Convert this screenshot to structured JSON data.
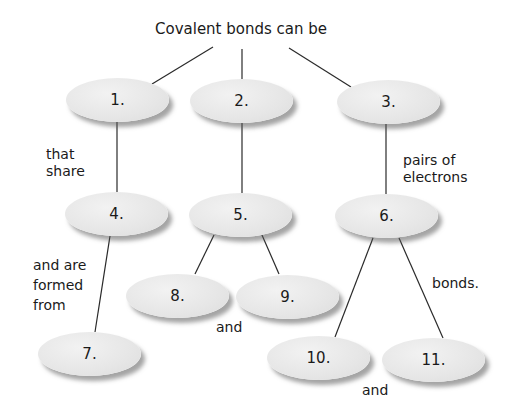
{
  "title": "Covalent bonds can be",
  "nodes": [
    {
      "id": "1",
      "label": "1."
    },
    {
      "id": "2",
      "label": "2."
    },
    {
      "id": "3",
      "label": "3."
    },
    {
      "id": "4",
      "label": "4."
    },
    {
      "id": "5",
      "label": "5."
    },
    {
      "id": "6",
      "label": "6."
    },
    {
      "id": "7",
      "label": "7."
    },
    {
      "id": "8",
      "label": "8."
    },
    {
      "id": "9",
      "label": "9."
    },
    {
      "id": "10",
      "label": "10."
    },
    {
      "id": "11",
      "label": "11."
    }
  ],
  "linking_phrases": {
    "that_share": [
      "that",
      "share"
    ],
    "pairs_of_electrons": [
      "pairs of",
      "electrons"
    ],
    "and_are_formed_from": [
      "and are",
      "formed",
      "from"
    ],
    "and_8_9": "and",
    "bonds": "bonds.",
    "and_10_11": "and"
  },
  "colors": {
    "node_fill": "#e6e6e6",
    "line": "#2a2a2a",
    "text": "#1a1a1a",
    "background": "#ffffff"
  }
}
